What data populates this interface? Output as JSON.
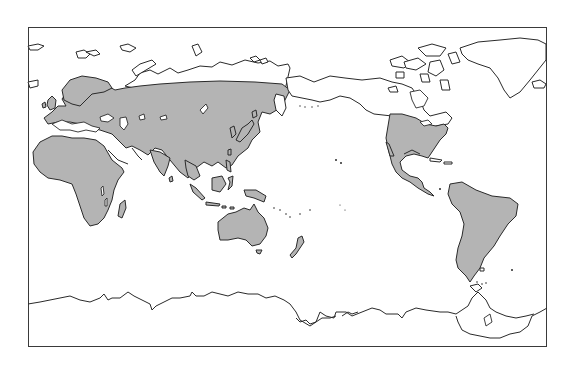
{
  "map": {
    "type": "world-distribution-map",
    "projection": "pacific-centered",
    "frame": {
      "left": 28,
      "top": 27,
      "width": 519,
      "height": 320
    },
    "colors": {
      "range_fill": "#b4b4b4",
      "outline": "#2a2a2a",
      "background": "#ffffff"
    },
    "shaded_regions": [
      "Europe",
      "Africa",
      "Asia (south of northern Siberia)",
      "Southeast Asia / Indonesia",
      "Japan",
      "Australia",
      "New Zealand",
      "United States / southern Canada",
      "Mexico / Central America",
      "South America"
    ],
    "unshaded_regions": [
      "Arctic Siberia",
      "Alaska",
      "Canada (north)",
      "Greenland",
      "Antarctica"
    ]
  }
}
